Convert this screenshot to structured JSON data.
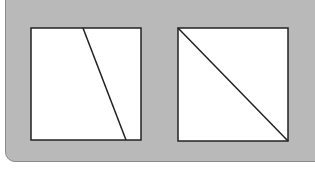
{
  "figure": {
    "background_color": "#b9b9b9",
    "square_fill": "#ffffff",
    "stroke_color": "#222222",
    "panels": [
      {
        "name": "left-square",
        "square": {
          "x": 31,
          "y": 28,
          "w": 110,
          "h": 112
        },
        "line": {
          "x1": 83,
          "y1": 28,
          "x2": 126,
          "y2": 140
        }
      },
      {
        "name": "right-square",
        "square": {
          "x": 178,
          "y": 28,
          "w": 110,
          "h": 113
        },
        "line": {
          "x1": 178,
          "y1": 28,
          "x2": 288,
          "y2": 141
        }
      }
    ]
  }
}
